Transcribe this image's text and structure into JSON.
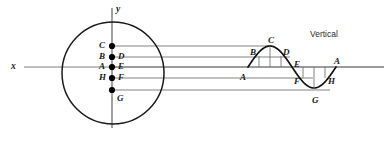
{
  "figure": {
    "title_note": "Vertical",
    "axes": {
      "x_label": "x",
      "y_label": "y"
    },
    "circle": {
      "cx": 113,
      "cy": 73,
      "r": 51,
      "stroke": "#1a1a1a"
    },
    "colors": {
      "ink": "#1a1a1a",
      "rule": "#6e6e6e",
      "dot": "#000000"
    },
    "circle_points": [
      {
        "label": "C",
        "label_side": "left",
        "x": 112,
        "y": 46,
        "dot": true
      },
      {
        "label": "B",
        "label_side": "left",
        "x": 112,
        "y": 57,
        "dot": true
      },
      {
        "label": "D",
        "label_side": "right",
        "x": 112,
        "y": 57,
        "dot": false
      },
      {
        "label": "A",
        "label_side": "left",
        "x": 112,
        "y": 67,
        "dot": true
      },
      {
        "label": "E",
        "label_side": "right",
        "x": 112,
        "y": 67,
        "dot": false
      },
      {
        "label": "H",
        "label_side": "left",
        "x": 112,
        "y": 78,
        "dot": true
      },
      {
        "label": "F",
        "label_side": "right",
        "x": 112,
        "y": 78,
        "dot": false
      },
      {
        "label": "G",
        "label_side": "below",
        "x": 112,
        "y": 90,
        "dot": true
      }
    ],
    "projection_lines": [
      {
        "from_label": "C",
        "y": 46,
        "x1": 112,
        "x2": 272
      },
      {
        "from_label": "B",
        "y": 57,
        "x1": 112,
        "x2": 290
      },
      {
        "from_label": "A",
        "y": 67,
        "x1": 112,
        "x2": 384
      },
      {
        "from_label": "H",
        "y": 78,
        "x1": 112,
        "x2": 313
      },
      {
        "from_label": "G",
        "y": 90,
        "x1": 112,
        "x2": 330
      }
    ],
    "wave": {
      "type": "sine",
      "baseline_y": 67,
      "x_start": 248,
      "x_end": 336,
      "amplitude": 21,
      "period": 88,
      "stroke": "#111111"
    },
    "wave_points": [
      {
        "label": "A",
        "x": 248,
        "y": 67,
        "label_dx": -8,
        "label_dy": 11,
        "tick": false
      },
      {
        "label": "B",
        "x": 259,
        "y": 56,
        "label_dx": -9,
        "label_dy": -3,
        "tick": true
      },
      {
        "label": "C",
        "x": 270,
        "y": 46,
        "label_dx": -2,
        "label_dy": -5,
        "tick": true
      },
      {
        "label": "D",
        "x": 281,
        "y": 56,
        "label_dx": 2,
        "label_dy": -3,
        "tick": true
      },
      {
        "label": "E",
        "x": 292,
        "y": 67,
        "label_dx": 2,
        "label_dy": -2,
        "tick": false
      },
      {
        "label": "F",
        "x": 303,
        "y": 78,
        "label_dx": -9,
        "label_dy": 4,
        "tick": true
      },
      {
        "label": "G",
        "x": 314,
        "y": 89,
        "label_dx": -2,
        "label_dy": 12,
        "tick": true
      },
      {
        "label": "H",
        "x": 325,
        "y": 78,
        "label_dx": 3,
        "label_dy": 4,
        "tick": true
      },
      {
        "label": "A",
        "x": 336,
        "y": 67,
        "label_dx": -2,
        "label_dy": -5,
        "tick": false
      }
    ]
  }
}
